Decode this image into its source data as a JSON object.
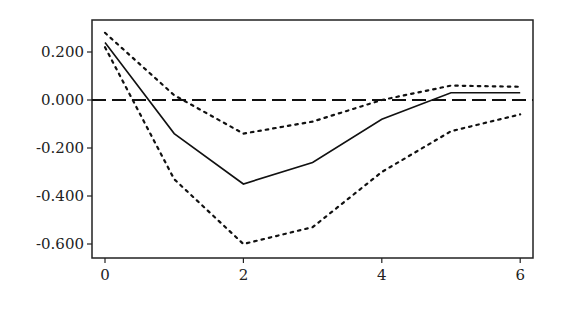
{
  "chart_data": {
    "type": "line",
    "title": "",
    "xlabel": "",
    "ylabel": "",
    "x": [
      0,
      1,
      2,
      3,
      4,
      5,
      6
    ],
    "xticks": [
      "0",
      "2",
      "4",
      "6"
    ],
    "yticks": [
      "0.200",
      "0.000",
      "-0.200",
      "-0.400",
      "-0.600"
    ],
    "ylim": [
      -0.65,
      0.32
    ],
    "grid": false,
    "legend": "none",
    "series": [
      {
        "name": "response",
        "style": "solid",
        "values": [
          0.24,
          -0.14,
          -0.35,
          -0.26,
          -0.08,
          0.03,
          0.03
        ]
      },
      {
        "name": "upper band",
        "style": "dotted",
        "values": [
          0.28,
          0.02,
          -0.14,
          -0.09,
          0.0,
          0.06,
          0.055
        ]
      },
      {
        "name": "lower band",
        "style": "dotted",
        "values": [
          0.22,
          -0.33,
          -0.6,
          -0.53,
          -0.3,
          -0.13,
          -0.06
        ]
      }
    ],
    "reference_line": {
      "y": 0.0,
      "style": "dashed"
    }
  }
}
